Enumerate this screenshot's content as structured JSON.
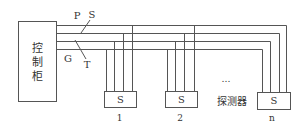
{
  "diagram": {
    "controller": {
      "label_chars": [
        "控",
        "制",
        "柜"
      ]
    },
    "bus_lines": {
      "labels": {
        "P": "P",
        "S": "S",
        "G": "G",
        "T": "T"
      }
    },
    "detectors": [
      {
        "symbol": "S",
        "index_label": "1"
      },
      {
        "symbol": "S",
        "index_label": "2"
      },
      {
        "symbol": "S",
        "index_label": "n"
      }
    ],
    "ellipsis": "…",
    "detector_caption": "探测器"
  }
}
